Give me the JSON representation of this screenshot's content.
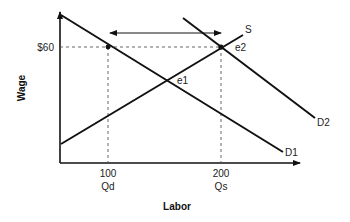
{
  "diagram": {
    "type": "labor-market supply-demand",
    "axes": {
      "x_label": "Labor",
      "y_label": "Wage"
    },
    "y_ticks": [
      {
        "label": "$60"
      }
    ],
    "x_ticks": [
      {
        "value": "100",
        "sub": "Qd"
      },
      {
        "value": "200",
        "sub": "Qs"
      }
    ],
    "curves": [
      {
        "id": "D1",
        "label": "D1"
      },
      {
        "id": "D2",
        "label": "D2"
      },
      {
        "id": "S",
        "label": "S"
      }
    ],
    "points": [
      {
        "id": "e1",
        "label": "e1"
      },
      {
        "id": "e2",
        "label": "e2"
      }
    ],
    "annotations": {
      "double_arrow": "gap between Qd and Qs at $60"
    },
    "colors": {
      "line": "#111111",
      "dashed": "#555555",
      "text": "#222222"
    }
  }
}
